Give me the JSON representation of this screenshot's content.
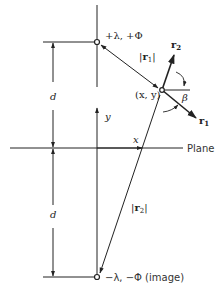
{
  "diagram": {
    "labels": {
      "source_charge": "+λ, +Φ",
      "image_charge": "−λ, −Φ (image)",
      "plane": "Plane",
      "field_point": "(x, y)",
      "r1_magnitude": "|r1|",
      "r2_magnitude": "|r2|",
      "r1_vector": "r1",
      "r2_vector": "r2",
      "angle": "β",
      "x_axis": "x",
      "y_axis": "y",
      "distance_upper": "d",
      "distance_lower": "d"
    },
    "colors": {
      "stroke": "#222222",
      "background": "#ffffff"
    }
  }
}
